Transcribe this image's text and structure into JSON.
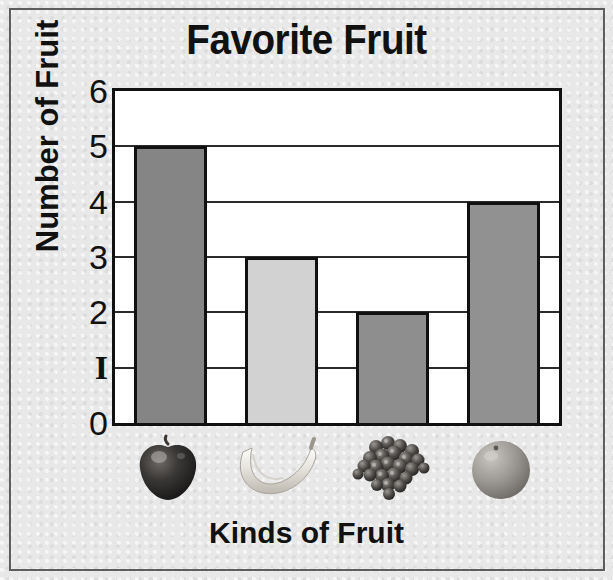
{
  "figure": {
    "title": "Favorite Fruit",
    "background_color": "#e8e8e8",
    "frame_color": "#5d5d5d"
  },
  "axes": {
    "y_title": "Number of Fruit",
    "x_title": "Kinds of Fruit",
    "y_ticks": [
      "6",
      "5",
      "4",
      "3",
      "2",
      "1",
      "0"
    ]
  },
  "chart_data": {
    "type": "bar",
    "title": "Favorite Fruit",
    "xlabel": "Kinds of Fruit",
    "ylabel": "Number of Fruit",
    "categories": [
      "Apple",
      "Banana",
      "Grapes",
      "Orange"
    ],
    "values": [
      5,
      3,
      2,
      4
    ],
    "ylim": [
      0,
      6
    ],
    "ytick_values": [
      0,
      1,
      2,
      3,
      4,
      5,
      6
    ],
    "grid": true,
    "legend": "none",
    "bar_colors": [
      "#858585",
      "#d2d2d2",
      "#8e8e8e",
      "#919191"
    ],
    "bar_edge_color": "#111111",
    "x_tick_style": "fruit-photographs",
    "bars": [
      {
        "category": "Apple",
        "value": 5,
        "color": "#858585",
        "icon": "apple-icon"
      },
      {
        "category": "Banana",
        "value": 3,
        "color": "#d2d2d2",
        "icon": "banana-icon"
      },
      {
        "category": "Grapes",
        "value": 2,
        "color": "#8e8e8e",
        "icon": "grapes-icon"
      },
      {
        "category": "Orange",
        "value": 4,
        "color": "#919191",
        "icon": "orange-icon"
      }
    ]
  },
  "fruit_labels": {
    "apple": "Apple",
    "banana": "Banana",
    "grapes": "Grapes",
    "orange": "Orange"
  }
}
